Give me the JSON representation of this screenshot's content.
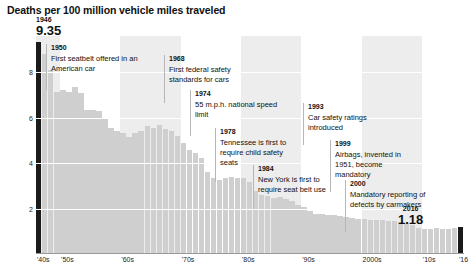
{
  "chart_data": {
    "type": "bar",
    "title": "Deaths per 100 million vehicle miles traveled",
    "xlabel": "",
    "ylabel": "",
    "ylim": [
      0,
      9.6
    ],
    "xlim": [
      1946,
      2016
    ],
    "grid": true,
    "legend": false,
    "yticks": [
      "8",
      "6",
      "4",
      "2"
    ],
    "ytick_values": [
      8,
      6,
      4,
      2
    ],
    "xticks": [
      "'40s",
      "'50s",
      "'60s",
      "'70s",
      "'80s",
      "'90s",
      "2000s",
      "'10s",
      "'16"
    ],
    "xtick_values": [
      1946,
      1950,
      1960,
      1970,
      1980,
      1990,
      2000,
      2010,
      2016
    ],
    "x": [
      1946,
      1947,
      1948,
      1949,
      1950,
      1951,
      1952,
      1953,
      1954,
      1955,
      1956,
      1957,
      1958,
      1959,
      1960,
      1961,
      1962,
      1963,
      1964,
      1965,
      1966,
      1967,
      1968,
      1969,
      1970,
      1971,
      1972,
      1973,
      1974,
      1975,
      1976,
      1977,
      1978,
      1979,
      1980,
      1981,
      1982,
      1983,
      1984,
      1985,
      1986,
      1987,
      1988,
      1989,
      1990,
      1991,
      1992,
      1993,
      1994,
      1995,
      1996,
      1997,
      1998,
      1999,
      2000,
      2001,
      2002,
      2003,
      2004,
      2005,
      2006,
      2007,
      2008,
      2009,
      2010,
      2011,
      2012,
      2013,
      2014,
      2015,
      2016
    ],
    "values": [
      9.35,
      8.82,
      8.11,
      7.13,
      7.24,
      7.14,
      7.36,
      7.07,
      6.33,
      6.34,
      6.28,
      5.98,
      5.56,
      5.41,
      5.31,
      5.16,
      5.31,
      5.41,
      5.63,
      5.54,
      5.7,
      5.5,
      5.4,
      5.21,
      4.88,
      4.57,
      4.43,
      4.24,
      3.59,
      3.35,
      3.25,
      3.35,
      3.39,
      3.34,
      3.35,
      3.17,
      2.76,
      2.58,
      2.57,
      2.47,
      2.51,
      2.44,
      2.32,
      2.17,
      2.08,
      1.91,
      1.75,
      1.75,
      1.73,
      1.73,
      1.69,
      1.64,
      1.58,
      1.55,
      1.53,
      1.51,
      1.51,
      1.48,
      1.44,
      1.46,
      1.42,
      1.36,
      1.26,
      1.15,
      1.11,
      1.1,
      1.14,
      1.1,
      1.08,
      1.15,
      1.18
    ],
    "highlight_years": [
      1946,
      2016
    ],
    "bar_color": "#cfcfcf",
    "highlight_color": "#1a1a1a",
    "band_color": "#ededed"
  },
  "endpoints": [
    {
      "id": "first",
      "year": "1946",
      "value": "9.35"
    },
    {
      "id": "last",
      "year": "2016",
      "value": "1.18"
    }
  ],
  "annotations": [
    {
      "year": "1950",
      "text": "First seatbelt offered in an American car"
    },
    {
      "year": "1968",
      "text": "First federal safety standards for cars"
    },
    {
      "year": "1974",
      "text": "55 m.p.h. national speed limit"
    },
    {
      "year": "1978",
      "text": "Tennessee is first to require child safety seats"
    },
    {
      "year": "1984",
      "text": "New York is first to require seat belt use"
    },
    {
      "year": "1993",
      "text": "Car safety ratings introduced"
    },
    {
      "year": "1999",
      "text": "Airbags, invented in 1951, become mandatory"
    },
    {
      "year": "2000",
      "text": "Mandatory reporting of defects by carmakers"
    }
  ]
}
